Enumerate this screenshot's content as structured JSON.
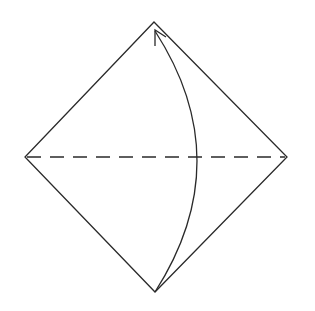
{
  "diagram": {
    "stroke_color": "#2a2a2a",
    "background": "#ffffff",
    "square": {
      "vertices": {
        "top": [
          154,
          22
        ],
        "right": [
          287,
          157
        ],
        "bottom": [
          155,
          292
        ],
        "left": [
          25,
          157
        ]
      }
    },
    "fold_line": {
      "style": "dashed",
      "from": [
        25,
        157
      ],
      "to": [
        287,
        157
      ]
    },
    "fold_arrow": {
      "from": [
        155,
        292
      ],
      "to": [
        155,
        30
      ],
      "bulge_x": 197,
      "direction": "up"
    }
  }
}
